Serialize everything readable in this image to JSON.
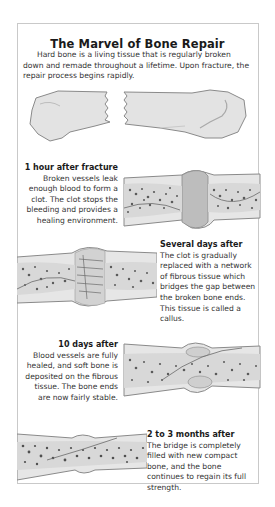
{
  "title": "The Marvel of Bone Repair",
  "intro": "Hard bone is a living tissue that is regularly broken down and remade throughout a lifetime. Upon fracture, the repair process begins rapidly.",
  "stages": [
    {
      "heading": "1 hour after fracture",
      "body": "Broken vessels leak enough blood to form a clot. The clot stops the bleeding and provides a healing environment.",
      "text_align": "right"
    },
    {
      "heading": "Several days after",
      "body": "The clot is gradually replaced with a network of fibrous tissue which bridges the gap between the broken bone ends. This tissue is called a callus.",
      "text_align": "left"
    },
    {
      "heading": "10 days after",
      "body": "Blood vessels are fully healed, and soft bone is deposited on the fibrous tissue. The bone ends are now fairly stable.",
      "text_align": "right"
    },
    {
      "heading": "2 to 3 months after",
      "body": "The bridge is completely filled with new compact bone, and the bone continues to regain its full strength.",
      "text_align": "left"
    }
  ],
  "illustrations": [
    "fractured-bone-illustration",
    "clot-stage-illustration",
    "callus-stage-illustration",
    "soft-bone-stage-illustration",
    "remodeled-bone-illustration"
  ],
  "colors": {
    "bone_fill": "#e3e3e3",
    "bone_outline": "#8a8a8a",
    "clot_fill": "#bdbdbd",
    "spongy_dots": "#5a5a5a",
    "frame_border": "#c9c9c9"
  }
}
